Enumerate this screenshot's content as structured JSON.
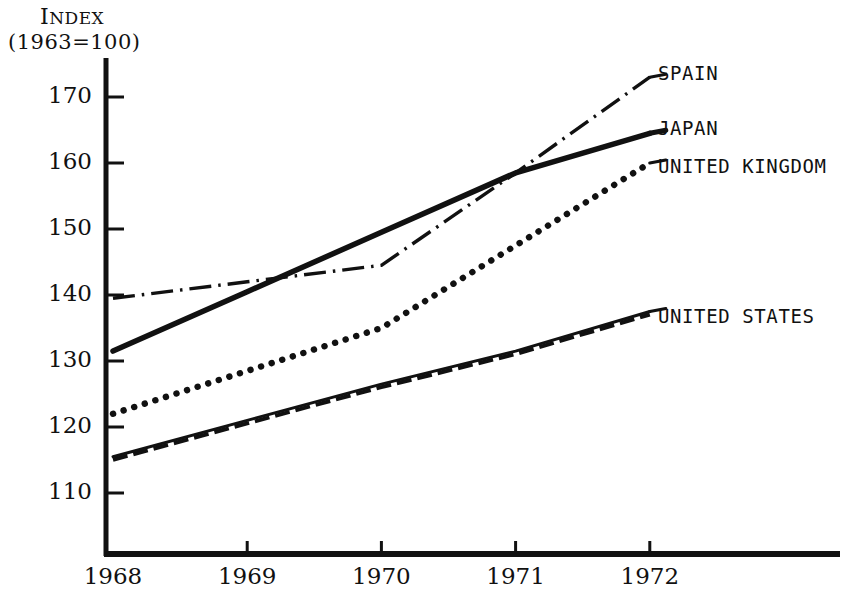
{
  "chart_data": {
    "type": "line",
    "title": "",
    "ylabel_line1": "INDEX",
    "ylabel_line2": "(1963=100)",
    "xlabel": "",
    "x": [
      1968,
      1969,
      1970,
      1971,
      1972
    ],
    "xtick_labels": [
      "1968",
      "1969",
      "1970",
      "1971",
      "1972"
    ],
    "ytick_labels": [
      "170",
      "160",
      "150",
      "140",
      "130",
      "120",
      "110"
    ],
    "ytick_values": [
      170,
      160,
      150,
      140,
      130,
      120,
      110
    ],
    "ylim": [
      103,
      175
    ],
    "xlim": [
      1967.95,
      1972.45
    ],
    "grid": false,
    "legend_position": "right-of-lines",
    "series": [
      {
        "name": "SPAIN",
        "style": "dash-dot",
        "label": "SPAIN",
        "values": [
          139.5,
          142.0,
          144.5,
          158.5,
          173.0
        ]
      },
      {
        "name": "JAPAN",
        "style": "solid-thick",
        "label": "JAPAN",
        "values": [
          131.5,
          140.5,
          149.5,
          158.5,
          164.5
        ]
      },
      {
        "name": "UNITED KINGDOM",
        "style": "dotted",
        "label": "UNITED KINGDOM",
        "values": [
          122.0,
          128.5,
          135.0,
          147.5,
          160.0
        ]
      },
      {
        "name": "UNITED STATES",
        "style": "solid-with-dashed-twin",
        "label": "UNITED STATES",
        "values": [
          115.5,
          121.0,
          126.5,
          131.5,
          137.5
        ]
      }
    ]
  },
  "labels": {
    "spain": "SPAIN",
    "japan": "JAPAN",
    "united_kingdom": "UNITED KINGDOM",
    "united_states": "UNITED STATES"
  },
  "axis": {
    "y_title_line1": "INDEX",
    "y_title_line2": "(1963=100)",
    "y_ticks": [
      "170",
      "160",
      "150",
      "140",
      "130",
      "120",
      "110"
    ],
    "x_ticks": [
      "1968",
      "1969",
      "1970",
      "1971",
      "1972"
    ]
  },
  "colors": {
    "ink": "#111111",
    "paper": "#ffffff"
  }
}
